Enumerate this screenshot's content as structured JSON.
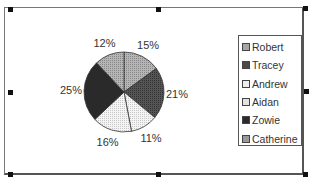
{
  "chart_data": {
    "type": "pie",
    "title": "",
    "start_angle": "12 o'clock",
    "direction": "clockwise",
    "legend_position": "right",
    "slices": [
      {
        "name": "Robert",
        "value": 15,
        "label": "15%",
        "color": "#a6a6a6",
        "pattern": "dotted-light"
      },
      {
        "name": "Tracey",
        "value": 21,
        "label": "21%",
        "color": "#4a4a4a",
        "pattern": "dotted-dark"
      },
      {
        "name": "Andrew",
        "value": 11,
        "label": "11%",
        "color": "#eeeeee",
        "pattern": "dotted-white"
      },
      {
        "name": "Aidan",
        "value": 16,
        "label": "16%",
        "color": "#e2e2e2",
        "pattern": "dotted-white"
      },
      {
        "name": "Zowie",
        "value": 25,
        "label": "25%",
        "color": "#2a2a2a",
        "pattern": "solid-dark"
      },
      {
        "name": "Catherine",
        "value": 12,
        "label": "12%",
        "color": "#9a9a9a",
        "pattern": "dotted-light"
      }
    ]
  }
}
